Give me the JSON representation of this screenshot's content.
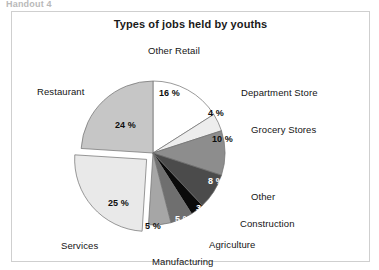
{
  "scan": {
    "header_fragment": "Handout 4"
  },
  "chart_data": {
    "type": "pie",
    "title": "Types of jobs held by youths",
    "xlabel": "",
    "ylabel": "",
    "legend": "none",
    "value_suffix": "%",
    "categories": [
      "Other Retail",
      "Department Store",
      "Grocery Stores",
      "Other",
      "Construction",
      "Agriculture",
      "Manufacturing",
      "Services",
      "Restaurant"
    ],
    "values": [
      16,
      4,
      10,
      8,
      3,
      5,
      5,
      25,
      24
    ],
    "value_labels": [
      "16 %",
      "4 %",
      "10 %",
      "8 %",
      "3 %",
      "5 %",
      "5 %",
      "25 %",
      "24 %"
    ],
    "colors": [
      "#ffffff",
      "#ededed",
      "#8d8d8d",
      "#4b4b4b",
      "#0a0a0a",
      "#6f6f6f",
      "#a6a6a6",
      "#e9e9e9",
      "#c6c6c6"
    ],
    "exploded": [
      false,
      false,
      false,
      false,
      false,
      false,
      false,
      true,
      false
    ],
    "slices": [
      {
        "name": "Other Retail",
        "value": 16,
        "value_label": "16 %",
        "color": "#ffffff",
        "pct_x": 147,
        "pct_y": 76,
        "pct_dark": false,
        "cat_x": 136,
        "cat_y": 33
      },
      {
        "name": "Department Store",
        "value": 4,
        "value_label": "4 %",
        "color": "#ededed",
        "pct_x": 196,
        "pct_y": 96,
        "pct_dark": false,
        "cat_x": 229,
        "cat_y": 75
      },
      {
        "name": "Grocery Stores",
        "value": 10,
        "value_label": "10 %",
        "color": "#8d8d8d",
        "pct_x": 200,
        "pct_y": 122,
        "pct_dark": false,
        "cat_x": 239,
        "cat_y": 112
      },
      {
        "name": "Other",
        "value": 8,
        "value_label": "8 %",
        "color": "#4b4b4b",
        "pct_x": 196,
        "pct_y": 164,
        "pct_dark": true,
        "cat_x": 239,
        "cat_y": 179
      },
      {
        "name": "Construction",
        "value": 3,
        "value_label": "3 %",
        "color": "#0a0a0a",
        "pct_x": 184,
        "pct_y": 191,
        "pct_dark": true,
        "cat_x": 228,
        "cat_y": 206
      },
      {
        "name": "Agriculture",
        "value": 5,
        "value_label": "5 %",
        "color": "#6f6f6f",
        "pct_x": 163,
        "pct_y": 202,
        "pct_dark": true,
        "cat_x": 197,
        "cat_y": 227
      },
      {
        "name": "Manufacturing",
        "value": 5,
        "value_label": "5 %",
        "color": "#a6a6a6",
        "pct_x": 133,
        "pct_y": 209,
        "pct_dark": false,
        "cat_x": 140,
        "cat_y": 244
      },
      {
        "name": "Services",
        "value": 25,
        "value_label": "25 %",
        "color": "#e9e9e9",
        "pct_x": 96,
        "pct_y": 186,
        "pct_dark": false,
        "cat_x": 49,
        "cat_y": 228
      },
      {
        "name": "Restaurant",
        "value": 24,
        "value_label": "24 %",
        "color": "#c6c6c6",
        "pct_x": 103,
        "pct_y": 108,
        "pct_dark": false,
        "cat_x": 25,
        "cat_y": 74
      }
    ],
    "geometry": {
      "cx": 141,
      "cy": 141,
      "r": 72,
      "start_angle_deg": -90,
      "explode_offset": 9,
      "explode_angle_deg": 135
    }
  }
}
